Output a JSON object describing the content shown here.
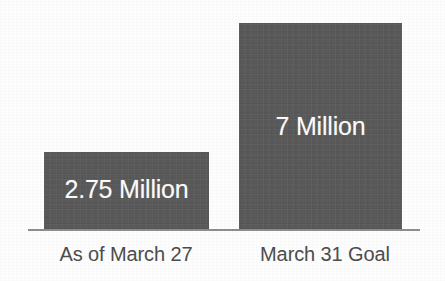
{
  "chart_data": {
    "type": "bar",
    "title": "",
    "subtitle": "",
    "xlabel": "",
    "ylabel": "",
    "categories": [
      "As of March 27",
      "March 31 Goal"
    ],
    "values": [
      2750000,
      7000000
    ],
    "value_labels": [
      "2.75 Million",
      "7 Million"
    ],
    "ylim": [
      0,
      7000000
    ],
    "grid": false,
    "legend": false,
    "legend_position": "none",
    "orientation": "vertical",
    "colors": {
      "bar_fill": "#5a5a5a",
      "bar_value_text": "#fbfbfb",
      "category_text": "#4d4d4d",
      "axis_line": "#8d8d8d",
      "background": "#fdfdfd"
    },
    "series": [
      {
        "name": "Count",
        "values": [
          2750000,
          7000000
        ]
      }
    ]
  },
  "bars": {
    "left": {
      "category": "As of March 27",
      "value_label": "2.75 Million"
    },
    "right": {
      "category": "March 31 Goal",
      "value_label": "7 Million"
    }
  }
}
